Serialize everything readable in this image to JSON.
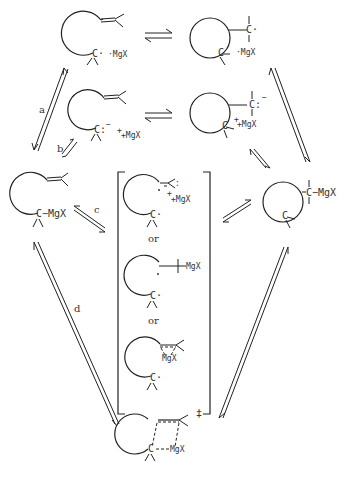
{
  "diagram": {
    "type": "reaction-scheme",
    "background": "#ffffff",
    "ink": "#222222",
    "species": {
      "top_left": {
        "atom": "C·",
        "counter": "·MgX"
      },
      "top_right": {
        "atom": "C·",
        "counter": "·MgX"
      },
      "mid_left": {
        "atom": "C:",
        "charge": "−",
        "counter": "+MgX"
      },
      "mid_right": {
        "atom": "C:",
        "charge": "−",
        "counter": "+MgX"
      },
      "left": {
        "atom": "C",
        "bond": "−MgX"
      },
      "right": {
        "atom": "C",
        "bond": "−MgX"
      },
      "bracket_1": {
        "atom": "C·",
        "charge": "−",
        "counter": "+MgX"
      },
      "bracket_or_1": "or",
      "bracket_2": {
        "atom": "C·",
        "bond": "MgX"
      },
      "bracket_or_2": "or",
      "bracket_3": {
        "atom": "C·",
        "bridge": "MgX"
      },
      "bottom": {
        "atom": "C",
        "bridge": "MgX",
        "ts": "‡"
      }
    },
    "steps": [
      "a",
      "b",
      "c",
      "d"
    ]
  }
}
